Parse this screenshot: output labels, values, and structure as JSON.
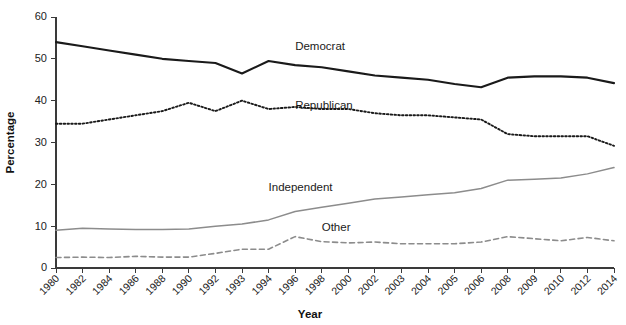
{
  "chart_data": {
    "type": "line",
    "title": "",
    "xlabel": "Year",
    "ylabel": "Percentage",
    "ylim": [
      0,
      60
    ],
    "yticks": [
      0,
      10,
      20,
      30,
      40,
      50,
      60
    ],
    "grid": false,
    "legend_position": "inline-labels",
    "categories": [
      "1980",
      "1982",
      "1984",
      "1986",
      "1988",
      "1990",
      "1992",
      "1993",
      "1994",
      "1996",
      "1998",
      "2000",
      "2002",
      "2003",
      "2004",
      "2005",
      "2006",
      "2008",
      "2009",
      "2010",
      "2012",
      "2014"
    ],
    "series": [
      {
        "name": "Democrat",
        "style": "solid",
        "color": "#1a1a1a",
        "label_x_category": "1996",
        "label_value": 52,
        "values": [
          54,
          53,
          52,
          51,
          50,
          49.5,
          49,
          46.5,
          49.5,
          48.5,
          48,
          47,
          46,
          45.5,
          45,
          44,
          43.2,
          45.5,
          45.8,
          45.8,
          45.5,
          44.2
        ]
      },
      {
        "name": "Republican",
        "style": "dotted",
        "color": "#1a1a1a",
        "label_x_category": "1996",
        "label_value": 38,
        "values": [
          34.5,
          34.5,
          35.5,
          36.5,
          37.5,
          39.5,
          37.5,
          40,
          38,
          38.5,
          38,
          38,
          37,
          36.5,
          36.5,
          36,
          35.5,
          32,
          31.5,
          31.5,
          31.5,
          29.2
        ]
      },
      {
        "name": "Independent",
        "style": "solid",
        "color": "#8c8c8c",
        "label_x_category": "1994",
        "label_value": 18.5,
        "values": [
          9,
          9.5,
          9.3,
          9.2,
          9.2,
          9.3,
          10,
          10.5,
          11.5,
          13.5,
          14.5,
          15.5,
          16.5,
          17,
          17.5,
          18,
          19,
          21,
          21.2,
          21.5,
          22.5,
          24
        ]
      },
      {
        "name": "Other",
        "style": "dashed",
        "color": "#8c8c8c",
        "label_x_category": "1998",
        "label_value": 8.8,
        "values": [
          2.5,
          2.6,
          2.5,
          2.8,
          2.6,
          2.6,
          3.5,
          4.5,
          4.5,
          7.5,
          6.3,
          6,
          6.2,
          5.8,
          5.8,
          5.8,
          6.2,
          7.5,
          7,
          6.5,
          7.3,
          6.5
        ]
      }
    ]
  }
}
